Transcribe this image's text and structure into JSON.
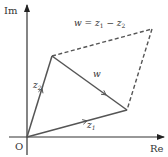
{
  "diagram": {
    "axes": {
      "x_label": "Re",
      "y_label": "Im",
      "origin_label": "O"
    },
    "points": {
      "O": [
        0,
        0
      ],
      "z1": [
        4,
        1
      ],
      "z2": [
        1,
        3
      ],
      "corner": [
        5,
        4
      ]
    },
    "vectors": [
      {
        "id": "z1",
        "label": "z",
        "subscript": "1",
        "from": "O",
        "to": "z1",
        "style": "solid"
      },
      {
        "id": "z2",
        "label": "z",
        "subscript": "2",
        "from": "O",
        "to": "z2",
        "style": "solid"
      },
      {
        "id": "w",
        "label": "w",
        "subscript": "",
        "from": "z2",
        "to": "z1",
        "style": "solid"
      }
    ],
    "dashed_edges": [
      {
        "from": "z2",
        "to": "corner"
      },
      {
        "from": "corner",
        "to": "z1"
      }
    ],
    "formula": {
      "lhs": "w",
      "eq": " = ",
      "a": "z",
      "a_sub": "1",
      "op": " − ",
      "b": "z",
      "b_sub": "2"
    },
    "colors": {
      "line": "#555555",
      "text": "#333333"
    }
  }
}
